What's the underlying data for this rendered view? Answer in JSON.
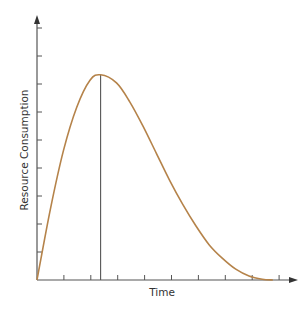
{
  "chart_data": {
    "type": "line",
    "title": "",
    "xlabel": "Time",
    "ylabel": "Resource Consumption",
    "x_ticks": 9,
    "y_ticks": 9,
    "x_tick_labels": [],
    "y_tick_labels": [],
    "grid": false,
    "legend": null,
    "xlim": [
      0,
      10
    ],
    "ylim": [
      0,
      10
    ],
    "annotations": [
      {
        "type": "vertical-line",
        "x": 2.4,
        "description": "line from the x-axis up to the curve's peak"
      }
    ],
    "series": [
      {
        "name": "Resource Consumption",
        "color": "#b5834a",
        "x": [
          0,
          0.5,
          1.0,
          1.5,
          2.0,
          2.4,
          3.0,
          3.5,
          4.0,
          4.5,
          5.0,
          5.5,
          6.0,
          6.5,
          7.0,
          7.5,
          8.0,
          8.5,
          8.9
        ],
        "y": [
          0,
          2.6,
          4.8,
          6.4,
          7.4,
          7.6,
          7.3,
          6.6,
          5.7,
          4.7,
          3.7,
          2.8,
          2.0,
          1.3,
          0.8,
          0.4,
          0.15,
          0.03,
          0
        ]
      }
    ]
  },
  "colors": {
    "axis": "#555555",
    "curve": "#b5834a",
    "peak_line": "#555555",
    "background": "#ffffff"
  }
}
